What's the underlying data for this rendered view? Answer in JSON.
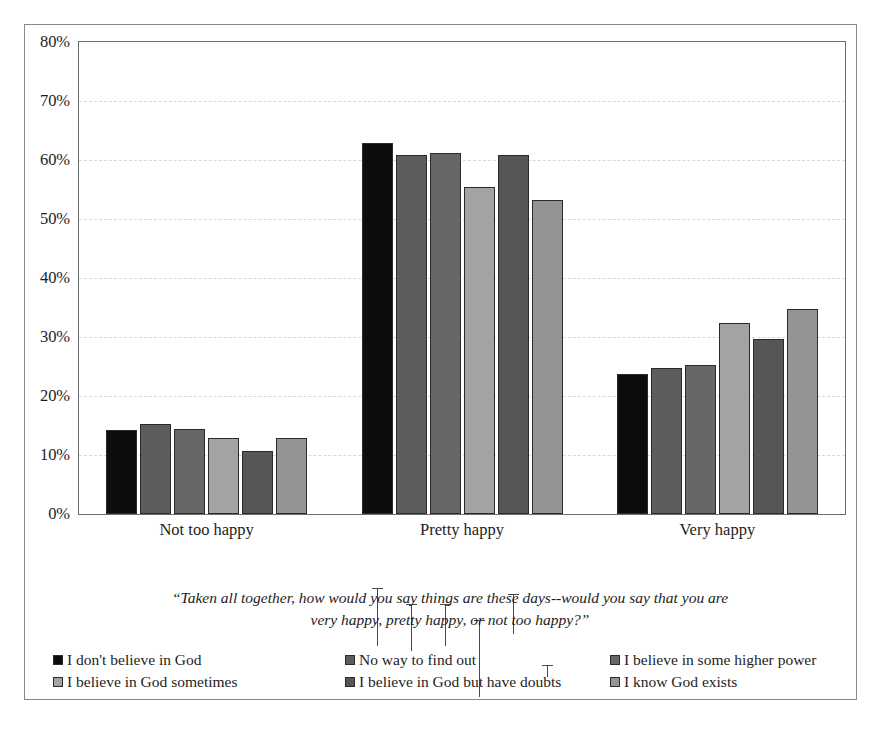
{
  "chart_data": {
    "type": "bar",
    "title": "",
    "subtitle": "",
    "xlabel": "",
    "ylabel": "",
    "categories": [
      "Not too happy",
      "Pretty happy",
      "Very happy"
    ],
    "ylim": [
      0,
      80
    ],
    "ytick_values": [
      0,
      10,
      20,
      30,
      40,
      50,
      60,
      70,
      80
    ],
    "ytick_labels": [
      "0%",
      "10%",
      "20%",
      "30%",
      "40%",
      "50%",
      "60%",
      "70%",
      "80%"
    ],
    "grid": true,
    "legend_position": "bottom",
    "error_bars": true,
    "series": [
      {
        "name": "I don't believe in God",
        "color": "#0d0d0d",
        "values": [
          14.3,
          62.8,
          23.8
        ],
        "err_low": [
          2.6,
          5.2,
          4.6
        ],
        "err_high": [
          3.0,
          4.6,
          4.2
        ]
      },
      {
        "name": "No way to find out",
        "color": "#5d5d5d",
        "values": [
          15.2,
          60.8,
          24.7
        ],
        "err_low": [
          2.9,
          4.0,
          5.4
        ],
        "err_high": [
          3.2,
          3.9,
          5.1
        ]
      },
      {
        "name": "I believe in some higher power",
        "color": "#676767",
        "values": [
          14.4,
          61.2,
          25.2
        ],
        "err_low": [
          2.4,
          3.6,
          4.2
        ],
        "err_high": [
          2.7,
          3.6,
          4.4
        ]
      },
      {
        "name": "I believe in God sometimes",
        "color": "#a3a3a3",
        "values": [
          12.9,
          55.5,
          32.3
        ],
        "err_low": [
          3.3,
          6.6,
          6.6
        ],
        "err_high": [
          3.6,
          6.6,
          7.3
        ]
      },
      {
        "name": "I believe in God but have doubts",
        "color": "#565656",
        "values": [
          10.6,
          60.8,
          29.6
        ],
        "err_low": [
          1.1,
          1.2,
          1.4
        ],
        "err_high": [
          1.4,
          5.7,
          1.7
        ]
      },
      {
        "name": "I know God exists",
        "color": "#949494",
        "values": [
          12.8,
          53.2,
          34.8
        ],
        "err_low": [
          1.0,
          0.9,
          1.2
        ],
        "err_high": [
          1.3,
          1.2,
          1.4
        ]
      }
    ],
    "annotation": "“Taken all together, how would you say things are these days--would you say that you are very happy, pretty happy, or not too happy?”"
  },
  "caption": {
    "line1": "“Taken all together, how would you say things are these days--would you say that you are",
    "line2": "very happy, pretty happy, or not too happy?”"
  },
  "legend": {
    "items": [
      {
        "label": "I don't believe in God",
        "color": "#0d0d0d"
      },
      {
        "label": "No way to find out",
        "color": "#5d5d5d"
      },
      {
        "label": "I believe in some higher power",
        "color": "#676767"
      },
      {
        "label": "I believe in God sometimes",
        "color": "#a3a3a3"
      },
      {
        "label": "I believe in God but have doubts",
        "color": "#565656"
      },
      {
        "label": "I know God exists",
        "color": "#949494"
      }
    ]
  }
}
